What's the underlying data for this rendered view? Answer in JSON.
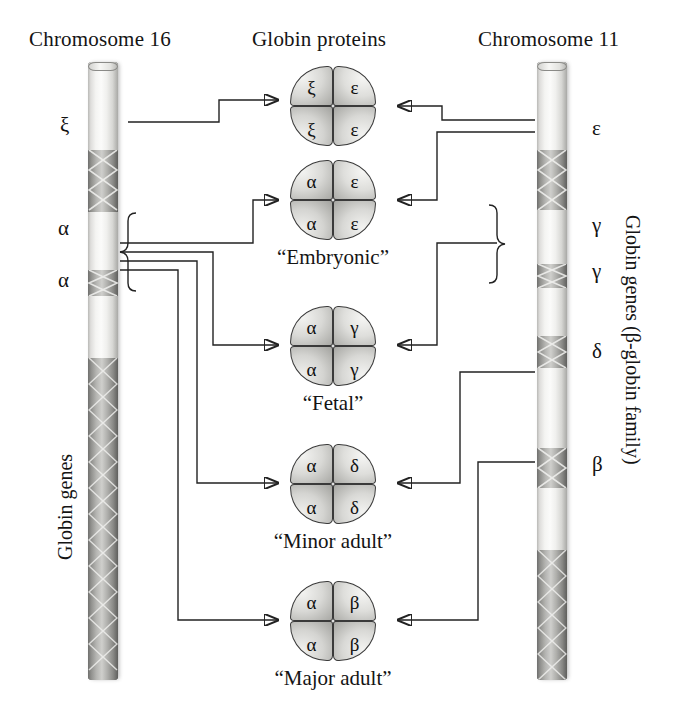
{
  "headings": {
    "left": "Chromosome 16",
    "center": "Globin proteins",
    "right": "Chromosome 11"
  },
  "side_captions": {
    "left": "Globin genes",
    "right": "Globin genes (β-globin family)"
  },
  "chromosome16": {
    "name": "Chromosome 16",
    "gene_labels": [
      {
        "symbol": "ξ",
        "top": 113
      },
      {
        "symbol": "α",
        "top": 216
      },
      {
        "symbol": "α",
        "top": 268
      }
    ]
  },
  "chromosome11": {
    "name": "Chromosome 11",
    "gene_labels": [
      {
        "symbol": "ε",
        "top": 116
      },
      {
        "symbol": "γ",
        "top": 213
      },
      {
        "symbol": "γ",
        "top": 259
      },
      {
        "symbol": "δ",
        "top": 339
      },
      {
        "symbol": "β",
        "top": 452
      }
    ]
  },
  "proteins": [
    {
      "id": "zeta2-epsilon2",
      "top_left": "ξ",
      "top_right": "ε",
      "bottom_left": "ξ",
      "bottom_right": "ε",
      "name": ""
    },
    {
      "id": "alpha2-epsilon2",
      "top_left": "α",
      "top_right": "ε",
      "bottom_left": "α",
      "bottom_right": "ε",
      "name": "“Embryonic”"
    },
    {
      "id": "alpha2-gamma2",
      "top_left": "α",
      "top_right": "γ",
      "bottom_left": "α",
      "bottom_right": "γ",
      "name": "“Fetal”"
    },
    {
      "id": "alpha2-delta2",
      "top_left": "α",
      "top_right": "δ",
      "bottom_left": "α",
      "bottom_right": "δ",
      "name": "“Minor adult”"
    },
    {
      "id": "alpha2-beta2",
      "top_left": "α",
      "top_right": "β",
      "bottom_left": "α",
      "bottom_right": "β",
      "name": "“Major adult”"
    }
  ],
  "colors": {
    "ink": "#1a1a1a",
    "line": "#222222",
    "chromosome_light": "#f4f4f2",
    "chromosome_dark": "#8f8f8c",
    "background": "#ffffff"
  }
}
